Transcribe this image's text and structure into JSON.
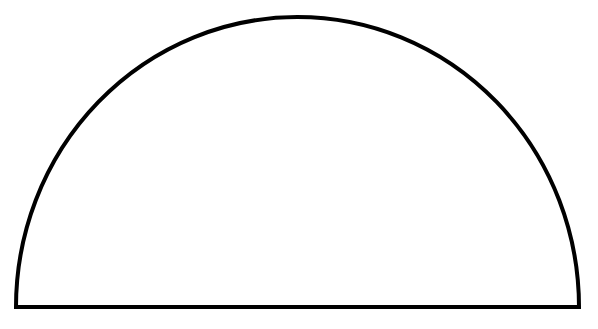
{
  "diagram": {
    "shape": "semicircle",
    "stroke_color": "#000000",
    "fill_color": "#ffffff",
    "background": "#ffffff",
    "stroke_width": 4,
    "left_x": 16,
    "right_x": 579,
    "baseline_y": 307,
    "top_y": 17
  }
}
